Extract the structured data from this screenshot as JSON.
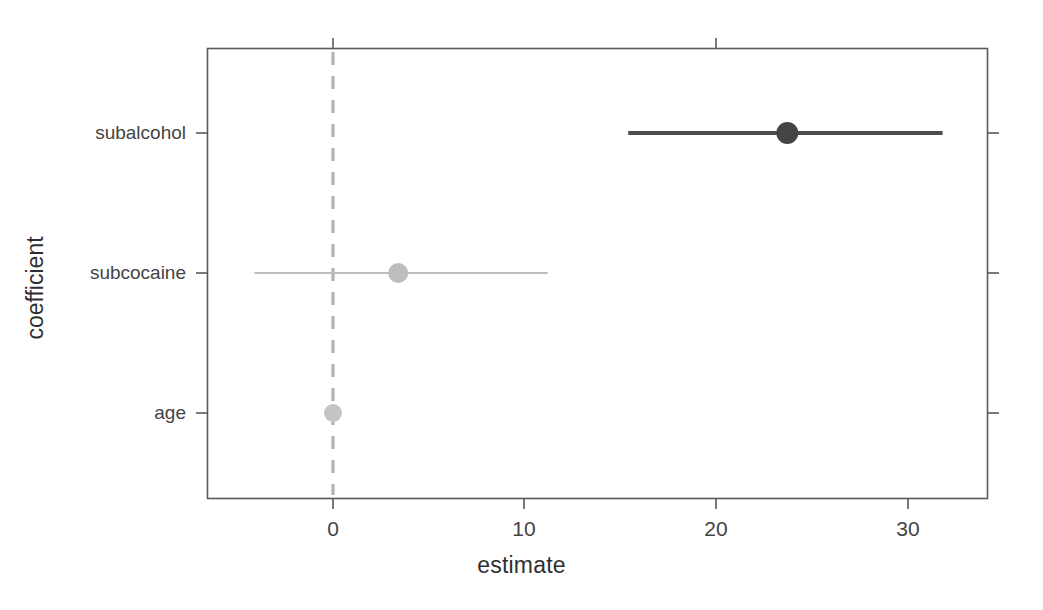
{
  "chart_data": {
    "type": "scatter",
    "plot_kind": "coefficient-forest-plot",
    "title": "",
    "xlabel": "estimate",
    "ylabel": "coefficient",
    "xlim": [
      -5.0,
      34.5
    ],
    "ylim_categories_top_to_bottom": [
      "subalcohol",
      "subcocaine",
      "age"
    ],
    "x_ticks": [
      0,
      10,
      20,
      30
    ],
    "x_tick_labels": [
      "0",
      "10",
      "20",
      "30"
    ],
    "y_ticks": [
      "subalcohol",
      "subcocaine",
      "age"
    ],
    "grid": false,
    "legend": null,
    "reference_line": {
      "x": 0,
      "style": "dashed",
      "color": "#b3b3b3"
    },
    "categories": [
      "subalcohol",
      "subcocaine",
      "age"
    ],
    "values": [
      23.7,
      3.4,
      0.0
    ],
    "series": [
      {
        "name": "estimate",
        "points": [
          {
            "label": "subalcohol",
            "estimate": 23.7,
            "conf_low": 15.4,
            "conf_high": 31.8,
            "color": "#4d4d4d",
            "line_width": 4,
            "marker_radius": 11
          },
          {
            "label": "subcocaine",
            "estimate": 3.4,
            "conf_low": -4.1,
            "conf_high": 11.2,
            "color": "#bfbfbf",
            "line_width": 2,
            "marker_radius": 10
          },
          {
            "label": "age",
            "estimate": 0.0,
            "conf_low": -0.1,
            "conf_high": 0.1,
            "color": "#c4c4c4",
            "line_width": 2,
            "marker_radius": 9
          }
        ]
      }
    ]
  },
  "axes": {
    "x_title": "estimate",
    "y_title": "coefficient",
    "x_tick_0": "0",
    "x_tick_10": "10",
    "x_tick_20": "20",
    "x_tick_30": "30",
    "y_tick_subalcohol": "subalcohol",
    "y_tick_subcocaine": "subcocaine",
    "y_tick_age": "age"
  },
  "colors": {
    "frame": "#595959",
    "tick": "#595959",
    "text": "#3b3b3b",
    "zero_line": "#b3b3b3",
    "dark_series": "#4d4d4d",
    "light_series": "#bfbfbf",
    "background": "#ffffff"
  }
}
